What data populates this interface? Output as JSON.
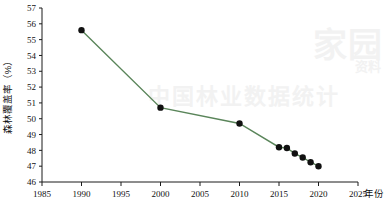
{
  "chart_data": {
    "type": "line",
    "title": "",
    "xlabel": "年份",
    "ylabel": "森林覆盖率（%）",
    "xlim": [
      1985,
      2025
    ],
    "ylim": [
      46,
      57
    ],
    "xticks": [
      "1985",
      "1990",
      "1995",
      "2000",
      "2005",
      "2010",
      "2015",
      "2020",
      "2025"
    ],
    "yticks": [
      "46",
      "47",
      "48",
      "49",
      "50",
      "51",
      "52",
      "53",
      "54",
      "55",
      "56",
      "57"
    ],
    "grid": false,
    "legend": "none",
    "series": [
      {
        "name": "森林覆盖率",
        "color": "#5a855a",
        "marker_color": "#111111",
        "x": [
          1990,
          2000,
          2010,
          2015,
          2016,
          2017,
          2018,
          2019,
          2020
        ],
        "values": [
          55.6,
          50.7,
          49.7,
          48.2,
          48.15,
          47.8,
          47.55,
          47.25,
          47.0
        ]
      }
    ]
  },
  "axis": {
    "x_title": "年份",
    "y_title": "森林覆盖率（%）"
  },
  "watermark": {
    "big": "家园",
    "mid": "中国林业数据统计",
    "small": "资料"
  }
}
